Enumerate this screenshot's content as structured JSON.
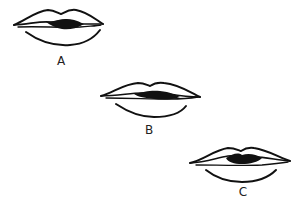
{
  "figure": {
    "items": [
      {
        "label": "A",
        "label_x": 61,
        "label_y": 55
      },
      {
        "label": "B",
        "label_x": 149,
        "label_y": 124
      },
      {
        "label": "C",
        "label_x": 243,
        "label_y": 186
      }
    ],
    "colors": {
      "ink": "#111111",
      "background": "#ffffff"
    }
  }
}
